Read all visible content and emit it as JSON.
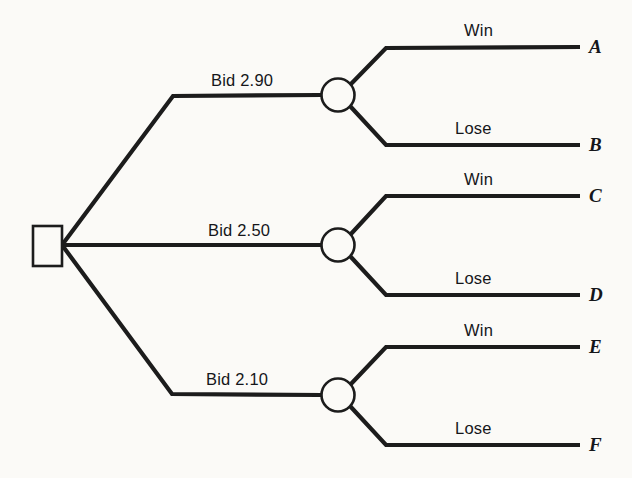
{
  "diagram": {
    "type": "decision-tree",
    "title": "",
    "decision_node": {
      "shape": "square",
      "label": ""
    },
    "branches": [
      {
        "id": "bid-290",
        "label": "Bid 2.90",
        "chance_node": {
          "shape": "circle"
        },
        "outcomes": [
          {
            "label": "Win",
            "terminal": "A"
          },
          {
            "label": "Lose",
            "terminal": "B"
          }
        ]
      },
      {
        "id": "bid-250",
        "label": "Bid 2.50",
        "chance_node": {
          "shape": "circle"
        },
        "outcomes": [
          {
            "label": "Win",
            "terminal": "C"
          },
          {
            "label": "Lose",
            "terminal": "D"
          }
        ]
      },
      {
        "id": "bid-210",
        "label": "Bid 2.10",
        "chance_node": {
          "shape": "circle"
        },
        "outcomes": [
          {
            "label": "Win",
            "terminal": "E"
          },
          {
            "label": "Lose",
            "terminal": "F"
          }
        ]
      }
    ],
    "colors": {
      "line": "#1c1c1c",
      "node_fill": "#fbfaf7",
      "text": "#15161a",
      "background": "#fbfaf7"
    }
  }
}
